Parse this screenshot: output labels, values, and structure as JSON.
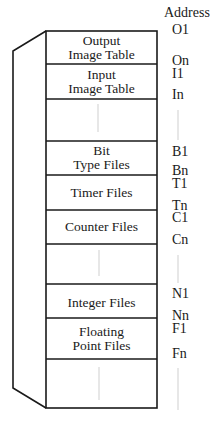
{
  "diagram": {
    "address_header": "Address",
    "sections": [
      {
        "label_lines": [
          "Output",
          "Image Table"
        ],
        "start": "O1",
        "end": "On"
      },
      {
        "label_lines": [
          "Input",
          "Image Table"
        ],
        "start": "I1",
        "end": "In"
      },
      {
        "label_lines": [],
        "start": "",
        "end": ""
      },
      {
        "label_lines": [
          "Bit",
          "Type Files"
        ],
        "start": "B1",
        "end": "Bn"
      },
      {
        "label_lines": [
          "Timer Files"
        ],
        "start": "T1",
        "end": "Tn"
      },
      {
        "label_lines": [
          "Counter Files"
        ],
        "start": "C1",
        "end": "Cn"
      },
      {
        "label_lines": [],
        "start": "",
        "end": ""
      },
      {
        "label_lines": [
          "Integer Files"
        ],
        "start": "N1",
        "end": "Nn"
      },
      {
        "label_lines": [
          "Floating",
          "Point Files"
        ],
        "start": "F1",
        "end": "Fn"
      },
      {
        "label_lines": [],
        "start": "",
        "end": ""
      }
    ]
  }
}
